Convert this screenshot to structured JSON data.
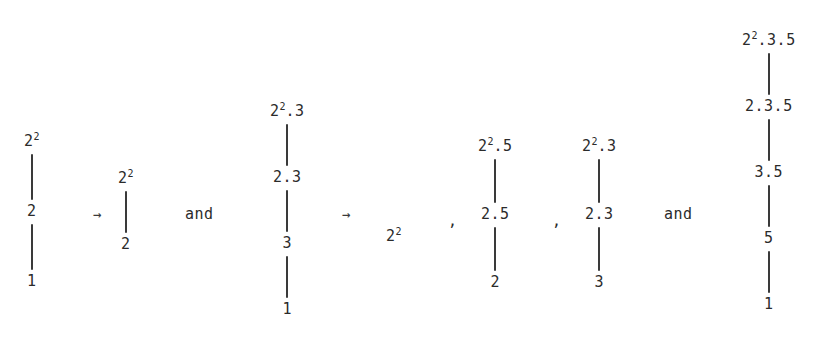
{
  "figure": {
    "background_color": "#ffffff",
    "ink_color": "#2b2b2b",
    "edge_color": "#3a3a3a",
    "arrow_glyph": "→",
    "conjunction": "and",
    "separator": ",",
    "chains": [
      {
        "id": "chain-1",
        "left": 24,
        "top": 133,
        "edge_height": 46,
        "nodes": [
          {
            "base": "2",
            "exp": "2"
          },
          {
            "base": "2",
            "exp": ""
          },
          {
            "base": "1",
            "exp": ""
          }
        ]
      },
      {
        "id": "chain-2",
        "left": 118,
        "top": 170,
        "edge_height": 42,
        "nodes": [
          {
            "base": "2",
            "exp": "2"
          },
          {
            "base": "2",
            "exp": ""
          }
        ]
      },
      {
        "id": "chain-3",
        "left": 270,
        "top": 103,
        "edge_height": 42,
        "nodes": [
          {
            "base": "2",
            "exp": "2",
            "suffix": ".3"
          },
          {
            "base": "2.3",
            "exp": ""
          },
          {
            "base": "3",
            "exp": ""
          },
          {
            "base": "1",
            "exp": ""
          }
        ]
      },
      {
        "id": "chain-4",
        "left": 478,
        "top": 138,
        "edge_height": 44,
        "nodes": [
          {
            "base": "2",
            "exp": "2",
            "suffix": ".5"
          },
          {
            "base": "2.5",
            "exp": ""
          },
          {
            "base": "2",
            "exp": ""
          }
        ]
      },
      {
        "id": "chain-5",
        "left": 582,
        "top": 138,
        "edge_height": 44,
        "nodes": [
          {
            "base": "2",
            "exp": "2",
            "suffix": ".3"
          },
          {
            "base": "2.3",
            "exp": ""
          },
          {
            "base": "3",
            "exp": ""
          }
        ]
      },
      {
        "id": "chain-6",
        "left": 742,
        "top": 32,
        "edge_height": 42,
        "nodes": [
          {
            "base": "2",
            "exp": "2",
            "suffix": ".3.5"
          },
          {
            "base": "2.3.5",
            "exp": ""
          },
          {
            "base": "3.5",
            "exp": ""
          },
          {
            "base": "5",
            "exp": ""
          },
          {
            "base": "1",
            "exp": ""
          }
        ]
      }
    ],
    "arrows": [
      {
        "id": "arrow-1",
        "label": "→",
        "left": 93,
        "top": 207
      },
      {
        "id": "arrow-2",
        "label": "→",
        "left": 342,
        "top": 207
      }
    ],
    "conjunctions": [
      {
        "id": "and-1",
        "label": "and",
        "left": 185,
        "top": 206
      },
      {
        "id": "and-2",
        "label": "and",
        "left": 664,
        "top": 206
      }
    ],
    "separators": [
      {
        "id": "comma-1",
        "label": ",",
        "left": 448,
        "top": 213
      },
      {
        "id": "comma-2",
        "label": ",",
        "left": 552,
        "top": 213
      }
    ],
    "loose_terms": [
      {
        "id": "term-1",
        "base": "2",
        "exp": "2",
        "left": 386,
        "top": 228
      }
    ]
  }
}
